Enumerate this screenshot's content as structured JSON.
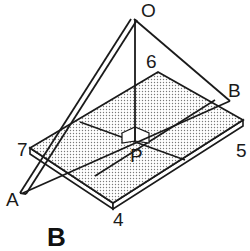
{
  "figure": {
    "caption": "B",
    "labels": {
      "apex": "O",
      "top_corner": "6",
      "right_point": "B",
      "left_corner": "7",
      "right_corner": "5",
      "bottom_corner": "4",
      "left_point": "A",
      "center": "P"
    },
    "colors": {
      "line": "#1a1a1a",
      "board_fill": "#e6e6e6",
      "background": "#ffffff"
    }
  }
}
